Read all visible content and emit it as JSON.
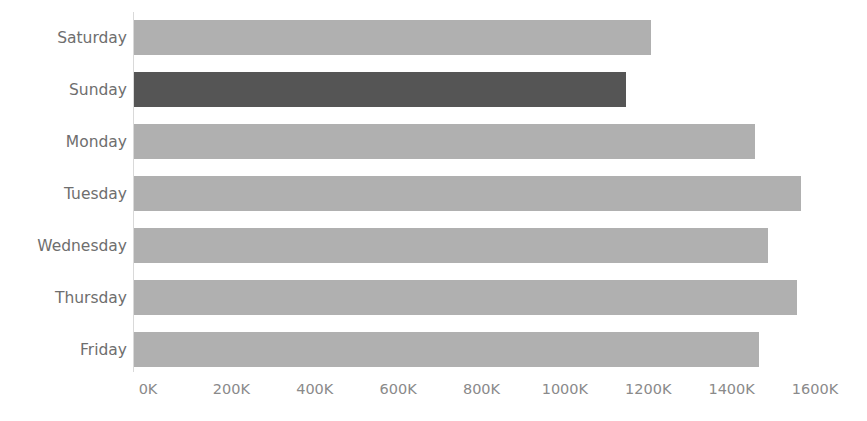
{
  "chart_data": {
    "type": "bar",
    "orientation": "horizontal",
    "title": "",
    "xlabel": "",
    "ylabel": "",
    "categories": [
      "Saturday",
      "Sunday",
      "Monday",
      "Tuesday",
      "Wednesday",
      "Thursday",
      "Friday"
    ],
    "values": [
      1240,
      1180,
      1490,
      1600,
      1520,
      1590,
      1500
    ],
    "value_unit": "K",
    "xlim": [
      0,
      1600
    ],
    "ylim": null,
    "grid": false,
    "legend": null,
    "xticks": [
      0,
      200,
      400,
      600,
      800,
      1000,
      1200,
      1400,
      1600
    ],
    "xtick_labels": [
      "0K",
      "200K",
      "400K",
      "600K",
      "800K",
      "1000K",
      "1200K",
      "1400K",
      "1600K"
    ],
    "ytick_labels": [
      "Saturday",
      "Sunday",
      "Monday",
      "Tuesday",
      "Wednesday",
      "Thursday",
      "Friday"
    ],
    "highlighted_category": "Sunday",
    "colors": {
      "bar_default": "#b0b0b0",
      "bar_highlight": "#555555",
      "axis_line": "#d9d9d9",
      "tick_label": "#8a8a8a",
      "category_label": "#6e6e6e",
      "background": "#ffffff"
    },
    "series": [
      {
        "name": "Value",
        "values": [
          1240,
          1180,
          1490,
          1600,
          1520,
          1590,
          1500
        ]
      }
    ]
  }
}
